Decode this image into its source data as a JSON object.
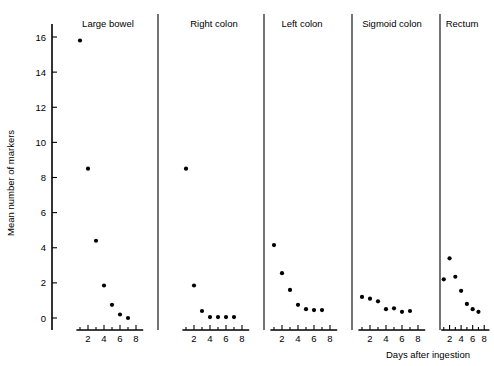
{
  "chart_data": {
    "type": "scatter",
    "title": "",
    "xlabel": "Days after ingestion",
    "ylabel": "Mean number of markers",
    "x": [
      1,
      2,
      3,
      4,
      5,
      6,
      7
    ],
    "xlim": [
      0,
      9
    ],
    "ylim": [
      0,
      17
    ],
    "yticks": [
      0,
      2,
      4,
      6,
      8,
      10,
      12,
      14,
      16
    ],
    "xticks": [
      2,
      4,
      6,
      8
    ],
    "grid": false,
    "legend_position": "none",
    "panels": [
      {
        "label": "Large bowel",
        "x": [
          1,
          2,
          3,
          4,
          5,
          6,
          7
        ],
        "values": [
          15.8,
          8.5,
          4.4,
          1.85,
          0.75,
          0.2,
          0.0
        ]
      },
      {
        "label": "Right colon",
        "x": [
          1,
          2,
          3,
          4,
          5,
          6,
          7
        ],
        "values": [
          8.5,
          1.85,
          0.4,
          0.05,
          0.05,
          0.05,
          0.05
        ]
      },
      {
        "label": "Left colon",
        "x": [
          1,
          2,
          3,
          4,
          5,
          6,
          7
        ],
        "values": [
          4.15,
          2.55,
          1.6,
          0.75,
          0.5,
          0.45,
          0.45
        ]
      },
      {
        "label": "Sigmoid colon",
        "x": [
          1,
          2,
          3,
          4,
          5,
          6,
          7
        ],
        "values": [
          1.2,
          1.1,
          0.95,
          0.5,
          0.55,
          0.35,
          0.4
        ]
      },
      {
        "label": "Rectum",
        "x": [
          1,
          2,
          3,
          4,
          5,
          6,
          7
        ],
        "values": [
          2.2,
          3.4,
          2.35,
          1.55,
          0.8,
          0.5,
          0.35
        ]
      }
    ]
  }
}
